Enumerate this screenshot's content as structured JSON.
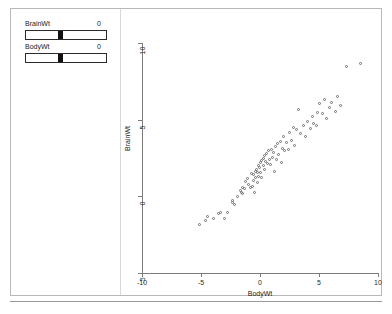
{
  "window": {
    "title": ""
  },
  "controls": {
    "sliders": [
      {
        "name": "BrainWt",
        "label": "BrainWt",
        "value": "0",
        "thumb_percent": 40
      },
      {
        "name": "BodyWt",
        "label": "BodyWt",
        "value": "0",
        "thumb_percent": 40
      }
    ]
  },
  "caption": {
    "text": ""
  },
  "chart_data": {
    "type": "scatter",
    "title": "",
    "xlabel": "BodyWt",
    "ylabel": "BrainWt",
    "xlim": [
      -10,
      10
    ],
    "ylim": [
      -5,
      10
    ],
    "xticks": [
      -10,
      -5,
      0,
      5,
      10
    ],
    "xticklabels": [
      "-10",
      "-5",
      "0",
      "5",
      "10"
    ],
    "yticks": [
      -5,
      0,
      5,
      10
    ],
    "yticklabels": [
      "-5",
      "0",
      "5",
      "10"
    ],
    "grid": false,
    "legend": null,
    "marker": "open-circle",
    "marker_color": "#6e6e6e",
    "points": [
      [
        -5.1,
        -1.9
      ],
      [
        -4.6,
        -1.6
      ],
      [
        -4.4,
        -1.35
      ],
      [
        -3.9,
        -1.5
      ],
      [
        -3.5,
        -1.15
      ],
      [
        -3.3,
        -1.1
      ],
      [
        -3.0,
        -1.45
      ],
      [
        -2.7,
        -1.1
      ],
      [
        -2.3,
        -0.3
      ],
      [
        -2.25,
        -0.45
      ],
      [
        -2.1,
        -0.55
      ],
      [
        -1.85,
        -0.05
      ],
      [
        -1.6,
        0.35
      ],
      [
        -1.5,
        0.2
      ],
      [
        -1.45,
        0.55
      ],
      [
        -1.4,
        0.15
      ],
      [
        -1.3,
        0.5
      ],
      [
        -1.15,
        0.95
      ],
      [
        -1.05,
        1.1
      ],
      [
        -0.9,
        0.75
      ],
      [
        -0.8,
        0.55
      ],
      [
        -0.7,
        1.45
      ],
      [
        -0.6,
        0.6
      ],
      [
        -0.55,
        1.0
      ],
      [
        -0.5,
        1.4
      ],
      [
        -0.45,
        0.25
      ],
      [
        -0.35,
        1.6
      ],
      [
        -0.3,
        1.2
      ],
      [
        -0.25,
        1.75
      ],
      [
        -0.2,
        0.9
      ],
      [
        -0.15,
        1.5
      ],
      [
        -0.1,
        2.0
      ],
      [
        -0.05,
        1.25
      ],
      [
        0.0,
        1.85
      ],
      [
        0.05,
        2.15
      ],
      [
        0.1,
        1.55
      ],
      [
        0.15,
        2.3
      ],
      [
        0.2,
        1.2
      ],
      [
        0.3,
        2.45
      ],
      [
        0.35,
        1.95
      ],
      [
        0.4,
        2.6
      ],
      [
        0.45,
        1.7
      ],
      [
        0.5,
        2.25
      ],
      [
        0.6,
        2.75
      ],
      [
        0.7,
        2.1
      ],
      [
        0.75,
        2.95
      ],
      [
        0.85,
        2.4
      ],
      [
        0.95,
        2.05
      ],
      [
        1.0,
        3.05
      ],
      [
        1.1,
        2.5
      ],
      [
        1.2,
        2.85
      ],
      [
        1.3,
        1.6
      ],
      [
        1.35,
        3.2
      ],
      [
        1.45,
        2.35
      ],
      [
        1.5,
        3.4
      ],
      [
        1.6,
        2.7
      ],
      [
        1.75,
        3.55
      ],
      [
        1.85,
        2.2
      ],
      [
        1.95,
        3.1
      ],
      [
        2.0,
        3.85
      ],
      [
        2.15,
        2.95
      ],
      [
        2.3,
        3.45
      ],
      [
        2.45,
        3.0
      ],
      [
        2.5,
        4.15
      ],
      [
        2.7,
        3.6
      ],
      [
        2.85,
        4.45
      ],
      [
        3.0,
        3.3
      ],
      [
        3.1,
        4.3
      ],
      [
        3.3,
        5.6
      ],
      [
        3.5,
        4.05
      ],
      [
        3.7,
        4.6
      ],
      [
        3.9,
        3.9
      ],
      [
        4.1,
        4.85
      ],
      [
        4.3,
        4.4
      ],
      [
        4.5,
        5.15
      ],
      [
        4.6,
        4.75
      ],
      [
        4.8,
        4.6
      ],
      [
        4.9,
        5.45
      ],
      [
        5.1,
        6.0
      ],
      [
        5.3,
        5.35
      ],
      [
        5.5,
        6.3
      ],
      [
        5.7,
        5.05
      ],
      [
        5.9,
        5.75
      ],
      [
        6.1,
        6.1
      ],
      [
        6.4,
        5.5
      ],
      [
        6.6,
        6.45
      ],
      [
        6.9,
        5.9
      ],
      [
        7.4,
        8.45
      ],
      [
        8.6,
        8.6
      ]
    ]
  }
}
